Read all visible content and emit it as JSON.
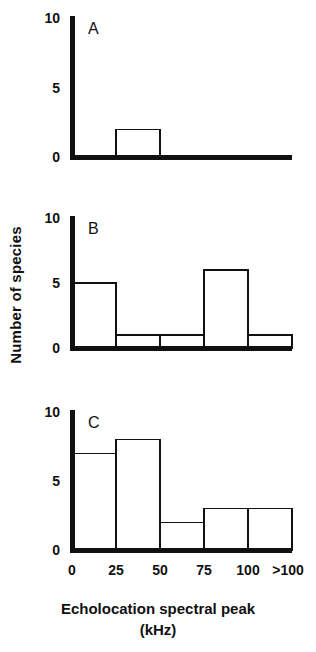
{
  "figure": {
    "axis_label_y": "Number of species",
    "axis_title_x_main": "Echolocation spectral peak",
    "axis_title_x_unit": "(kHz)",
    "y_ticks": [
      "0",
      "5",
      "10"
    ],
    "x_ticks": [
      "0",
      "25",
      "50",
      "75",
      "100",
      ">100"
    ],
    "panel_labels": [
      "A",
      "B",
      "C"
    ],
    "ink_color": "#111111",
    "background_color": "#ffffff"
  },
  "chart_data": [
    {
      "type": "bar",
      "title": "A",
      "panel": "A",
      "categories": [
        "0-25",
        "25-50",
        "50-75",
        "75-100",
        ">100"
      ],
      "bin_edges": [
        0,
        25,
        50,
        75,
        100,
        125
      ],
      "values": [
        0,
        2,
        0,
        0,
        0
      ],
      "xlabel": "Echolocation spectral peak (kHz)",
      "ylabel": "Number of species",
      "ylim": [
        0,
        10
      ],
      "yticks": [
        0,
        5,
        10
      ],
      "xticklabels": [
        "0",
        "25",
        "50",
        "75",
        "100",
        ">100"
      ],
      "grid": false,
      "legend": false
    },
    {
      "type": "bar",
      "title": "B",
      "panel": "B",
      "categories": [
        "0-25",
        "25-50",
        "50-75",
        "75-100",
        ">100"
      ],
      "bin_edges": [
        0,
        25,
        50,
        75,
        100,
        125
      ],
      "values": [
        5,
        1,
        1,
        6,
        1
      ],
      "xlabel": "Echolocation spectral peak (kHz)",
      "ylabel": "Number of species",
      "ylim": [
        0,
        10
      ],
      "yticks": [
        0,
        5,
        10
      ],
      "xticklabels": [
        "0",
        "25",
        "50",
        "75",
        "100",
        ">100"
      ],
      "grid": false,
      "legend": false
    },
    {
      "type": "bar",
      "title": "C",
      "panel": "C",
      "categories": [
        "0-25",
        "25-50",
        "50-75",
        "75-100",
        ">100"
      ],
      "bin_edges": [
        0,
        25,
        50,
        75,
        100,
        125
      ],
      "values": [
        7,
        8,
        2,
        3,
        3
      ],
      "xlabel": "Echolocation spectral peak (kHz)",
      "ylabel": "Number of species",
      "ylim": [
        0,
        10
      ],
      "yticks": [
        0,
        5,
        10
      ],
      "xticklabels": [
        "0",
        "25",
        "50",
        "75",
        "100",
        ">100"
      ],
      "grid": false,
      "legend": false
    }
  ]
}
